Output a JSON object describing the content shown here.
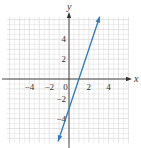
{
  "chart_data": {
    "type": "line",
    "title": "",
    "xlabel": "x",
    "ylabel": "y",
    "xlim": [
      -6,
      6
    ],
    "ylim": [
      -6.5,
      6.5
    ],
    "grid": true,
    "x_ticks": [
      -4,
      -2,
      0,
      2,
      4
    ],
    "y_ticks": [
      -4,
      -2,
      2,
      4
    ],
    "x_tick_labels": [
      "−4",
      "−2",
      "0",
      "2",
      "4"
    ],
    "y_tick_labels": [
      "−4",
      "−2",
      "2",
      "4"
    ],
    "series": [
      {
        "name": "y = 3x − 3",
        "equation": "y = 3x - 3",
        "x": [
          -1.1,
          3.1
        ],
        "y": [
          -6.3,
          6.3
        ],
        "color": "#2e7bbf",
        "arrows": "both"
      }
    ],
    "legend": null
  },
  "colors": {
    "grid": "#d9d9d9",
    "axis": "#333333",
    "line": "#2e7bbf"
  }
}
